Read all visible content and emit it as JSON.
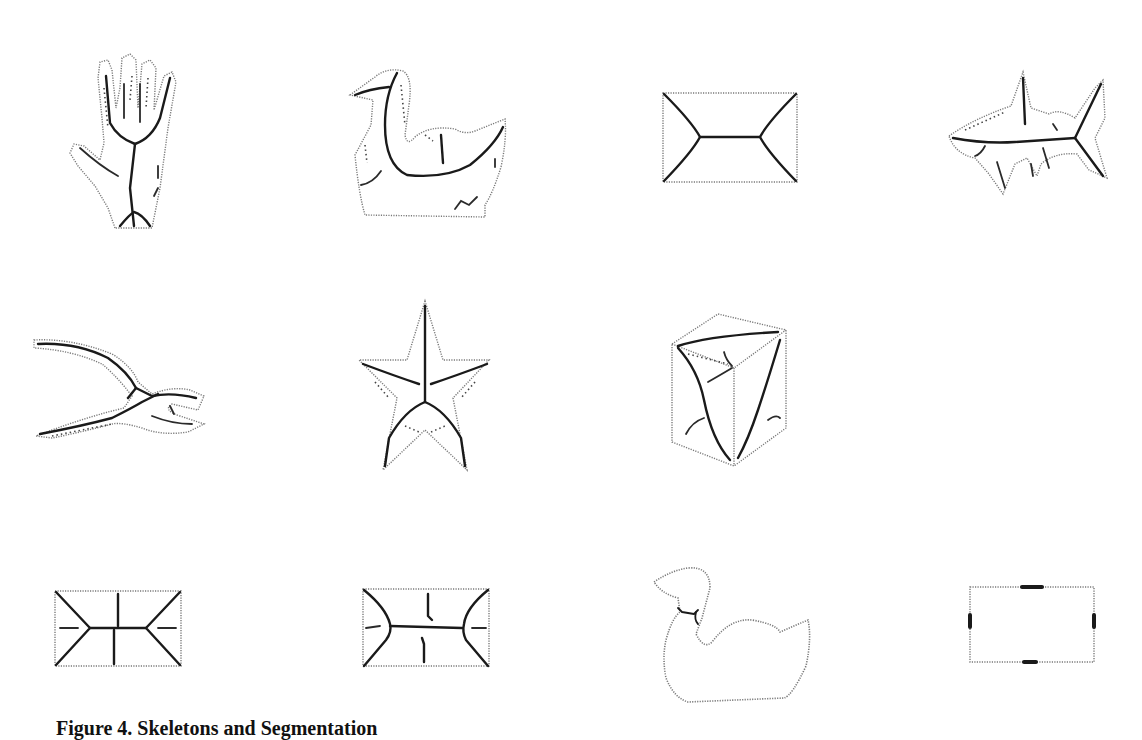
{
  "figure": {
    "caption": "Figure 4. Skeletons and Segmentation",
    "layout": {
      "rows": 3,
      "columns": 4
    },
    "panels": [
      {
        "row": 1,
        "col": 1,
        "shape": "hand",
        "description": "hand silhouette with medial-axis skeleton"
      },
      {
        "row": 1,
        "col": 2,
        "shape": "duck",
        "description": "duck silhouette with skeleton"
      },
      {
        "row": 1,
        "col": 3,
        "shape": "rectangle",
        "description": "rectangle with medial-axis skeleton"
      },
      {
        "row": 1,
        "col": 4,
        "shape": "shark",
        "description": "shark silhouette with skeleton"
      },
      {
        "row": 2,
        "col": 1,
        "shape": "pliers",
        "description": "pliers silhouette with skeleton"
      },
      {
        "row": 2,
        "col": 2,
        "shape": "star",
        "description": "five-point star with skeleton"
      },
      {
        "row": 2,
        "col": 3,
        "shape": "cube",
        "description": "3D cube drawing with skeleton"
      },
      {
        "row": 3,
        "col": 1,
        "shape": "rectangle",
        "description": "rectangle skeleton with spurs, variant 1"
      },
      {
        "row": 3,
        "col": 2,
        "shape": "rectangle",
        "description": "rectangle skeleton with spurs, variant 2"
      },
      {
        "row": 3,
        "col": 3,
        "shape": "duck",
        "description": "duck outline segmentation"
      },
      {
        "row": 3,
        "col": 4,
        "shape": "rectangle",
        "description": "rectangle outline with segmentation markers"
      }
    ]
  }
}
